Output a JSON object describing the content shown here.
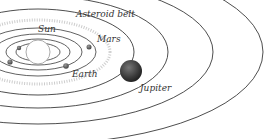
{
  "diagram": {
    "labels": {
      "sun": "Sun",
      "asteroid_belt": "Asteroid belt",
      "mars": "Mars",
      "earth": "Earth",
      "jupiter": "Jupiter"
    },
    "colors": {
      "orbit": "#3a3a3a",
      "planet": "#555555",
      "jupiter": "#3c3c3c",
      "asteroid": "#b8b8b8",
      "text": "#333333"
    }
  }
}
